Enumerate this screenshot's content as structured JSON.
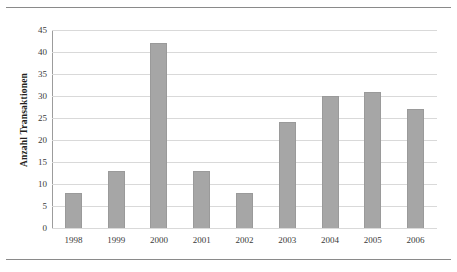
{
  "chart_data": {
    "type": "bar",
    "title": "",
    "xlabel": "",
    "ylabel": "Anzahl Transaktionen",
    "categories": [
      "1998",
      "1999",
      "2000",
      "2001",
      "2002",
      "2003",
      "2004",
      "2005",
      "2006"
    ],
    "values": [
      8,
      13,
      42,
      13,
      8,
      24,
      30,
      31,
      27
    ],
    "ylim": [
      0,
      45
    ],
    "yticks": [
      "0",
      "5",
      "10",
      "15",
      "20",
      "25",
      "30",
      "35",
      "40",
      "45"
    ],
    "ytick_values": [
      0,
      5,
      10,
      15,
      20,
      25,
      30,
      35,
      40,
      45
    ],
    "grid": true,
    "legend": false,
    "bar_color": "#a6a6a6",
    "grid_color": "#d9d9d9",
    "axis_color": "#9c9c9c",
    "background": "#ffffff"
  }
}
